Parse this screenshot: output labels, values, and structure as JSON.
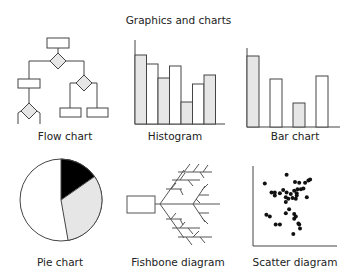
{
  "title": "Graphics and charts",
  "colors": {
    "line": "#444444",
    "gray_fill": "#e6e6e6",
    "black_fill": "#000000",
    "white_fill": "#ffffff"
  },
  "panels": [
    {
      "id": "flow",
      "label": "Flow chart"
    },
    {
      "id": "histogram",
      "label": "Histogram"
    },
    {
      "id": "bar",
      "label": "Bar chart"
    },
    {
      "id": "pie",
      "label": "Pie chart"
    },
    {
      "id": "fishbone",
      "label": "Fishbone diagram"
    },
    {
      "id": "scatter",
      "label": "Scatter diagram"
    }
  ],
  "chart_data": [
    {
      "type": "bar",
      "title": "Histogram",
      "categories": [
        "1",
        "2",
        "3",
        "4",
        "5",
        "6",
        "7"
      ],
      "values": [
        82,
        71,
        55,
        69,
        26,
        48,
        59
      ],
      "fills": [
        "gray",
        "white",
        "gray",
        "white",
        "gray",
        "white",
        "gray"
      ],
      "xlabel": "",
      "ylabel": "",
      "ylim": [
        0,
        100
      ],
      "grid": false
    },
    {
      "type": "bar",
      "title": "Bar chart",
      "categories": [
        "1",
        "2",
        "3",
        "4"
      ],
      "values": [
        85,
        57,
        28,
        61
      ],
      "fills": [
        "gray",
        "white",
        "gray",
        "white"
      ],
      "xlabel": "",
      "ylabel": "",
      "ylim": [
        0,
        100
      ],
      "grid": false
    },
    {
      "type": "pie",
      "title": "Pie chart",
      "categories": [
        "Black",
        "Gray",
        "White"
      ],
      "values": [
        15,
        32,
        53
      ]
    },
    {
      "type": "scatter",
      "title": "Scatter diagram",
      "x": [
        14,
        40,
        50,
        55,
        62,
        66,
        68,
        57,
        60,
        53,
        49,
        52,
        45,
        40,
        36,
        26,
        32,
        22,
        26,
        64,
        39,
        51,
        52,
        42,
        47,
        39,
        43,
        39,
        49,
        51,
        49,
        16,
        20,
        27,
        32,
        55,
        56,
        48,
        54
      ],
      "y": [
        78,
        89,
        80,
        79,
        79,
        82,
        83,
        71,
        72,
        71,
        69,
        66,
        65,
        67,
        70,
        67,
        66,
        67,
        63,
        61,
        61,
        59,
        63,
        59,
        60,
        55,
        46,
        41,
        40,
        37,
        34,
        39,
        37,
        27,
        27,
        27,
        22,
        15,
        28
      ],
      "xlim": [
        0,
        100
      ],
      "ylim": [
        0,
        100
      ],
      "grid": false
    }
  ]
}
